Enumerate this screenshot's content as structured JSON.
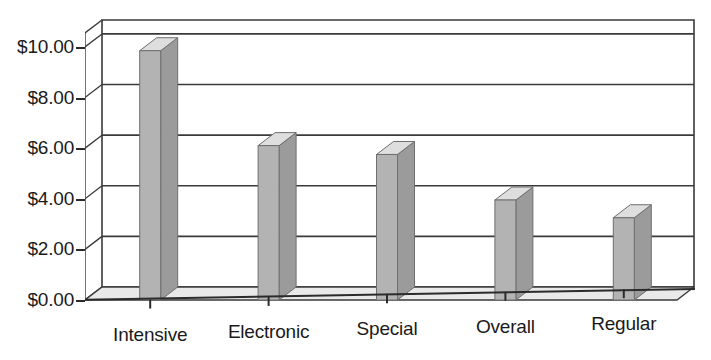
{
  "chart_data": {
    "type": "bar",
    "title": "",
    "subtitle": "",
    "xlabel": "",
    "ylabel": "",
    "categories": [
      "Intensive",
      "Electronic",
      "Special",
      "Overall",
      "Regular"
    ],
    "values": [
      9.85,
      6.1,
      5.75,
      3.95,
      3.25
    ],
    "ytick_labels": [
      "$10.00",
      "$8.00",
      "$6.00",
      "$4.00",
      "$2.00",
      "$0.00"
    ],
    "ytick_values": [
      10,
      8,
      6,
      4,
      2,
      0
    ],
    "ylim": [
      0,
      10.55
    ],
    "grid": "horizontal",
    "legend": "none",
    "style": "3d-bars-grayscale",
    "colors": {
      "bar_front": "#b3b3b3",
      "bar_top": "#dedede",
      "bar_side": "#9b9b9b",
      "floor": "#e9e9e9",
      "gridline": "#3a3a3a",
      "axis": "#2b2b2b",
      "text": "#1a1a1a",
      "background": "#ffffff"
    }
  }
}
